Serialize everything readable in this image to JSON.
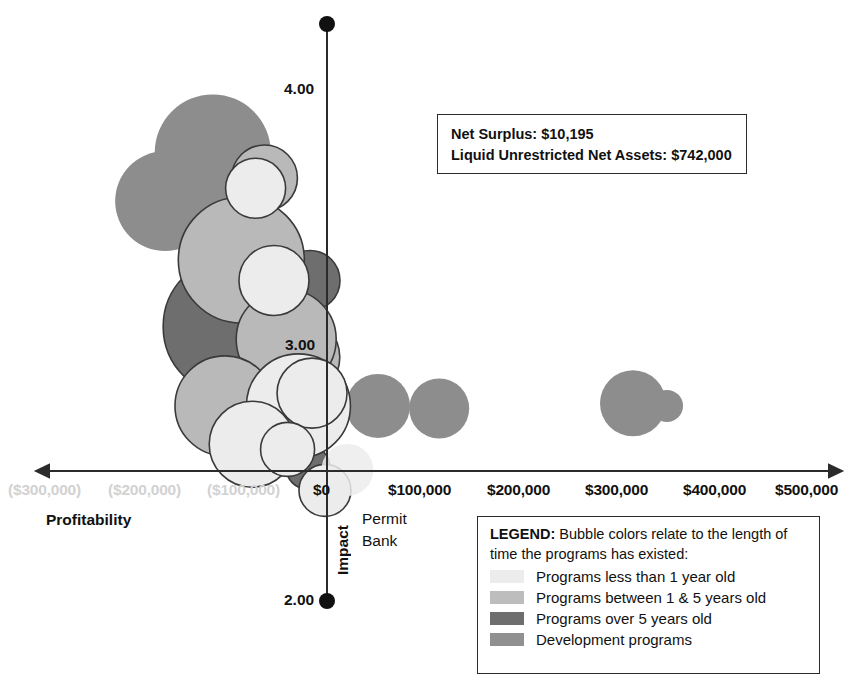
{
  "chart_data": {
    "type": "scatter",
    "title": "",
    "xlabel": "Profitability",
    "ylabel": "Impact",
    "xlim": [
      -330000,
      540000
    ],
    "ylim": [
      2.0,
      4.25
    ],
    "grid": false,
    "legend_position": "bottom-right",
    "x_tick_labels": [
      "($300,000)",
      "($200,000)",
      "($100,000)",
      "$0",
      "$100,000",
      "$200,000",
      "$300,000",
      "$400,000",
      "$500,000"
    ],
    "x_tick_values": [
      -300000,
      -200000,
      -100000,
      0,
      100000,
      200000,
      300000,
      400000,
      500000
    ],
    "y_tick_labels": [
      "4.00",
      "3.00",
      "2.00"
    ],
    "y_tick_values": [
      4.0,
      3.0,
      2.0
    ],
    "annotations": [
      {
        "text": "Permit Bank",
        "x": 30000,
        "y": 2.52
      }
    ],
    "series": [
      {
        "name": "Programs less than 1 year old",
        "color": "#ececec",
        "stroke": "#3a3a3a",
        "points": [
          {
            "x": -105000,
            "y": 3.62,
            "r": 30
          },
          {
            "x": -78000,
            "y": 3.26,
            "r": 35
          },
          {
            "x": -42000,
            "y": 2.77,
            "r": 52
          },
          {
            "x": -22000,
            "y": 2.82,
            "r": 35
          },
          {
            "x": -110000,
            "y": 2.62,
            "r": 43
          },
          {
            "x": -58000,
            "y": 2.6,
            "r": 27
          },
          {
            "x": -3000,
            "y": 2.44,
            "r": 26
          }
        ]
      },
      {
        "name": "Programs between 1 & 5 years old",
        "color": "#b9b9b9",
        "stroke": "#3a3a3a",
        "points": [
          {
            "x": -126000,
            "y": 3.34,
            "r": 63
          },
          {
            "x": -92000,
            "y": 3.66,
            "r": 33
          },
          {
            "x": -40000,
            "y": 2.96,
            "r": 40
          },
          {
            "x": -60000,
            "y": 3.03,
            "r": 50
          },
          {
            "x": -150000,
            "y": 2.77,
            "r": 50
          }
        ]
      },
      {
        "name": "Programs over 5 years old",
        "color": "#6e6e6e",
        "stroke": "#3a3a3a",
        "points": [
          {
            "x": -138000,
            "y": 3.08,
            "r": 70
          },
          {
            "x": -73000,
            "y": 3.02,
            "r": 36
          },
          {
            "x": -38000,
            "y": 2.98,
            "r": 18
          },
          {
            "x": -25000,
            "y": 3.26,
            "r": 30
          },
          {
            "x": -50000,
            "y": 2.88,
            "r": 10
          },
          {
            "x": -60000,
            "y": 2.8,
            "r": 28
          },
          {
            "x": -28000,
            "y": 2.53,
            "r": 22
          }
        ]
      },
      {
        "name": "Development programs",
        "color": "#8d8d8d",
        "stroke": "none",
        "points": [
          {
            "x": -238000,
            "y": 3.57,
            "r": 50
          },
          {
            "x": -168000,
            "y": 3.76,
            "r": 58
          },
          {
            "x": 75000,
            "y": 2.77,
            "r": 32
          },
          {
            "x": 165000,
            "y": 2.76,
            "r": 30
          },
          {
            "x": 450000,
            "y": 2.78,
            "r": 33
          },
          {
            "x": 500000,
            "y": 2.77,
            "r": 16
          }
        ]
      }
    ]
  },
  "info_box": {
    "line1": "Net Surplus: $10,195",
    "line2": "Liquid Unrestricted Net Assets: $742,000"
  },
  "legend": {
    "title": "LEGEND:",
    "description": " Bubble colors relate to the length of time the programs has existed:",
    "items": [
      {
        "label": "Programs less than 1 year old",
        "color": "#ececec"
      },
      {
        "label": "Programs between 1 & 5 years old",
        "color": "#bdbdbd"
      },
      {
        "label": "Programs over 5 years old",
        "color": "#6e6e6e"
      },
      {
        "label": "Development programs",
        "color": "#909090"
      }
    ]
  },
  "axes": {
    "x_title": "Profitability",
    "y_title": "Impact",
    "permit_bank_line1": "Permit",
    "permit_bank_line2": "Bank"
  }
}
